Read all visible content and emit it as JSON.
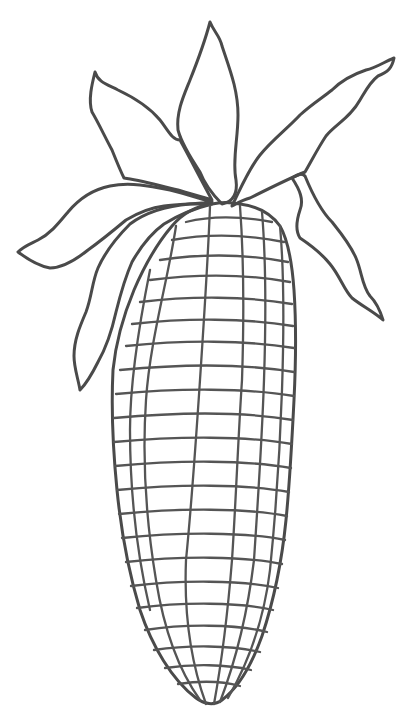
{
  "image": {
    "subject": "Ear of corn line-art coloring page",
    "background_color": "#ffffff",
    "ink_color": "#4a4a4a"
  },
  "illustration": {
    "leaves": [
      {
        "name": "left-upper-leaf"
      },
      {
        "name": "top-center-leaf"
      },
      {
        "name": "right-upper-leaf"
      },
      {
        "name": "left-lower-leaf"
      },
      {
        "name": "left-drooping-leaf"
      },
      {
        "name": "right-drooping-leaf"
      }
    ],
    "cob": {
      "kernel_columns": 8,
      "kernel_rows": 24
    }
  }
}
